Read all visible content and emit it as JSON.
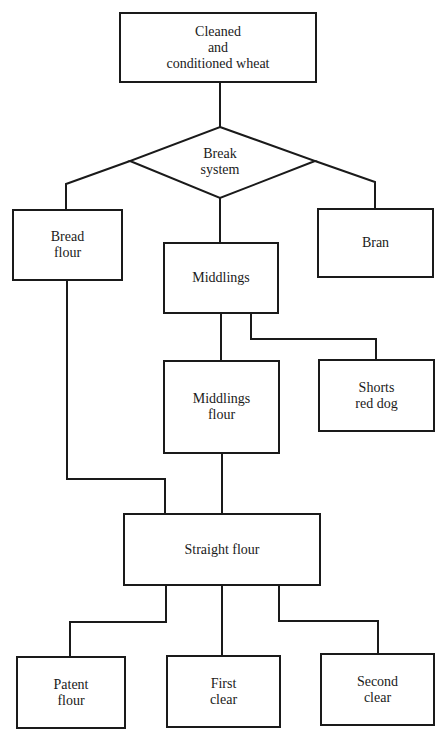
{
  "diagram": {
    "nodes": {
      "wheat": {
        "label": "Cleaned\nand\nconditioned wheat",
        "shape": "rectangle"
      },
      "break": {
        "label": "Break\nsystem",
        "shape": "diamond"
      },
      "bread_flour": {
        "label": "Bread\nflour",
        "shape": "rectangle"
      },
      "middlings": {
        "label": "Middlings",
        "shape": "rectangle"
      },
      "bran": {
        "label": "Bran",
        "shape": "rectangle"
      },
      "middlings_flour": {
        "label": "Middlings\nflour",
        "shape": "rectangle"
      },
      "shorts": {
        "label": "Shorts\nred dog",
        "shape": "rectangle"
      },
      "straight_flour": {
        "label": "Straight flour",
        "shape": "rectangle"
      },
      "patent_flour": {
        "label": "Patent\nflour",
        "shape": "rectangle"
      },
      "first_clear": {
        "label": "First\nclear",
        "shape": "rectangle"
      },
      "second_clear": {
        "label": "Second\nclear",
        "shape": "rectangle"
      }
    },
    "edges": [
      [
        "wheat",
        "break"
      ],
      [
        "break",
        "bread_flour"
      ],
      [
        "break",
        "middlings"
      ],
      [
        "break",
        "bran"
      ],
      [
        "middlings",
        "middlings_flour"
      ],
      [
        "middlings",
        "shorts"
      ],
      [
        "middlings_flour",
        "straight_flour"
      ],
      [
        "bread_flour",
        "straight_flour"
      ],
      [
        "straight_flour",
        "patent_flour"
      ],
      [
        "straight_flour",
        "first_clear"
      ],
      [
        "straight_flour",
        "second_clear"
      ]
    ]
  }
}
